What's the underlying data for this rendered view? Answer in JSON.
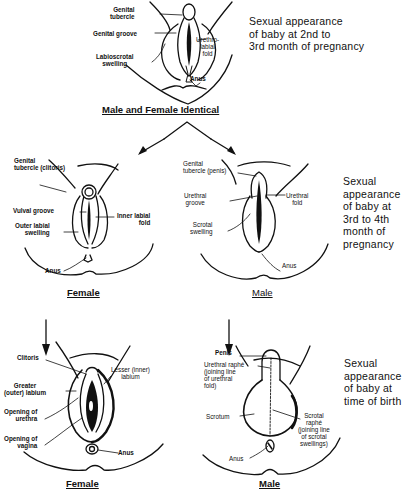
{
  "stage1": {
    "labels": {
      "genital_tubercle": "Genital\ntubercle",
      "genital_groove": "Genital groove",
      "labioscrotal_swelling": "Labioscrotal\nswelling",
      "urethrolabial_fold": "Urethro-\nlabial\nfold",
      "anus": "Anus"
    },
    "description": "Sexual appearance\nof baby at 2nd to\n3rd month of pregnancy",
    "caption": "Male and Female Identical"
  },
  "stage2": {
    "female": {
      "labels": {
        "genital_tubercle": "Genital\ntubercle (clitoris)",
        "vulval_groove": "Vulval groove",
        "outer_labial_swelling": "Outer labial\nswelling",
        "inner_labial_fold": "Inner labial\nfold",
        "anus": "Anus"
      },
      "caption": "Female"
    },
    "male": {
      "labels": {
        "genital_tubercle": "Genital\ntubercle (penis)",
        "urethral_groove": "Urethral\ngroove",
        "urethral_fold": "Urethral\nfold",
        "scrotal_swelling": "Scrotal\nswelling",
        "anus": "Anus"
      },
      "caption": "Male"
    },
    "description": "Sexual\nappearance\nof baby at\n3rd to 4th\nmonth of\npregnancy"
  },
  "stage3": {
    "female": {
      "labels": {
        "clitoris": "Clitoris",
        "greater_labium": "Greater\n(outer) labium",
        "opening_of_urethra": "Opening of\nurethra",
        "opening_of_vagina": "Opening of\nvagina",
        "lesser_labium": "Lesser (inner)\nlabium",
        "anus": "Anus"
      },
      "caption": "Female"
    },
    "male": {
      "labels": {
        "penis": "Penis",
        "urethral_raphe": "Urethral raphé\n(joining line\nof urethral\nfold)",
        "scrotum": "Scrotum",
        "scrotal_raphe": "Scrotal\nraphé\n(joining line\nof scrotal\nswellings)",
        "anus": "Anus"
      },
      "caption": "Male"
    },
    "description": "Sexual\nappearance\nof baby at\ntime of birth"
  }
}
